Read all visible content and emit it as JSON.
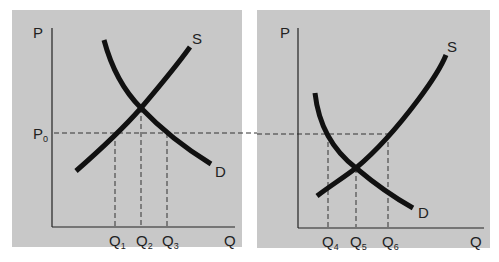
{
  "colors": {
    "panel_bg": "#c8c8c8",
    "curve": "#111111",
    "axis": "#222222",
    "dashed": "#333333",
    "page_bg": "#ffffff"
  },
  "left_panel": {
    "y_axis_label": "P",
    "x_axis_label": "Q",
    "price_label": "P",
    "price_subscript": "0",
    "supply_label": "S",
    "demand_label": "D",
    "q_labels": [
      {
        "main": "Q",
        "sub": "1"
      },
      {
        "main": "Q",
        "sub": "2"
      },
      {
        "main": "Q",
        "sub": "3"
      }
    ]
  },
  "right_panel": {
    "y_axis_label": "P",
    "x_axis_label": "Q",
    "supply_label": "S",
    "demand_label": "D",
    "q_labels": [
      {
        "main": "Q",
        "sub": "4"
      },
      {
        "main": "Q",
        "sub": "5"
      },
      {
        "main": "Q",
        "sub": "6"
      }
    ]
  }
}
